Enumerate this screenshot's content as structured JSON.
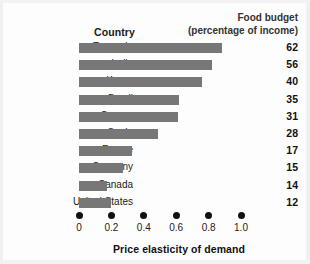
{
  "header": {
    "country_label": "Country",
    "budget_line1": "Food budget",
    "budget_line2": "(percentage of income)"
  },
  "axis": {
    "xlabel": "Price elasticity of demand",
    "ticks": [
      "0",
      "0.2",
      "0.4",
      "0.6",
      "0.8",
      "1.0"
    ]
  },
  "colors": {
    "bar": "#777777",
    "text": "#111111",
    "background": "#fdfdfd"
  },
  "chart_data": {
    "type": "bar",
    "orientation": "horizontal",
    "title": "",
    "xlabel": "Price elasticity of demand",
    "ylabel": "Country",
    "xlim": [
      0,
      1.0
    ],
    "xticks": [
      0,
      0.2,
      0.4,
      0.6,
      0.8,
      1.0
    ],
    "grid": false,
    "legend": false,
    "categories": [
      "Tanzania",
      "India",
      "Korea",
      "Brazil",
      "Greece",
      "Spain",
      "France",
      "Germany",
      "Canada",
      "United States"
    ],
    "values": [
      0.88,
      0.82,
      0.76,
      0.62,
      0.61,
      0.49,
      0.33,
      0.27,
      0.17,
      0.2
    ],
    "data_labels": [
      62,
      56,
      40,
      35,
      31,
      28,
      17,
      15,
      14,
      12
    ],
    "data_labels_header": "Food budget (percentage of income)",
    "rows": [
      {
        "country": "Tanzania",
        "elasticity": 0.88,
        "food_budget": 62
      },
      {
        "country": "India",
        "elasticity": 0.82,
        "food_budget": 56
      },
      {
        "country": "Korea",
        "elasticity": 0.76,
        "food_budget": 40
      },
      {
        "country": "Brazil",
        "elasticity": 0.62,
        "food_budget": 35
      },
      {
        "country": "Greece",
        "elasticity": 0.61,
        "food_budget": 31
      },
      {
        "country": "Spain",
        "elasticity": 0.49,
        "food_budget": 28
      },
      {
        "country": "France",
        "elasticity": 0.33,
        "food_budget": 17
      },
      {
        "country": "Germany",
        "elasticity": 0.27,
        "food_budget": 15
      },
      {
        "country": "Canada",
        "elasticity": 0.17,
        "food_budget": 14
      },
      {
        "country": "United States",
        "elasticity": 0.2,
        "food_budget": 12
      }
    ]
  }
}
